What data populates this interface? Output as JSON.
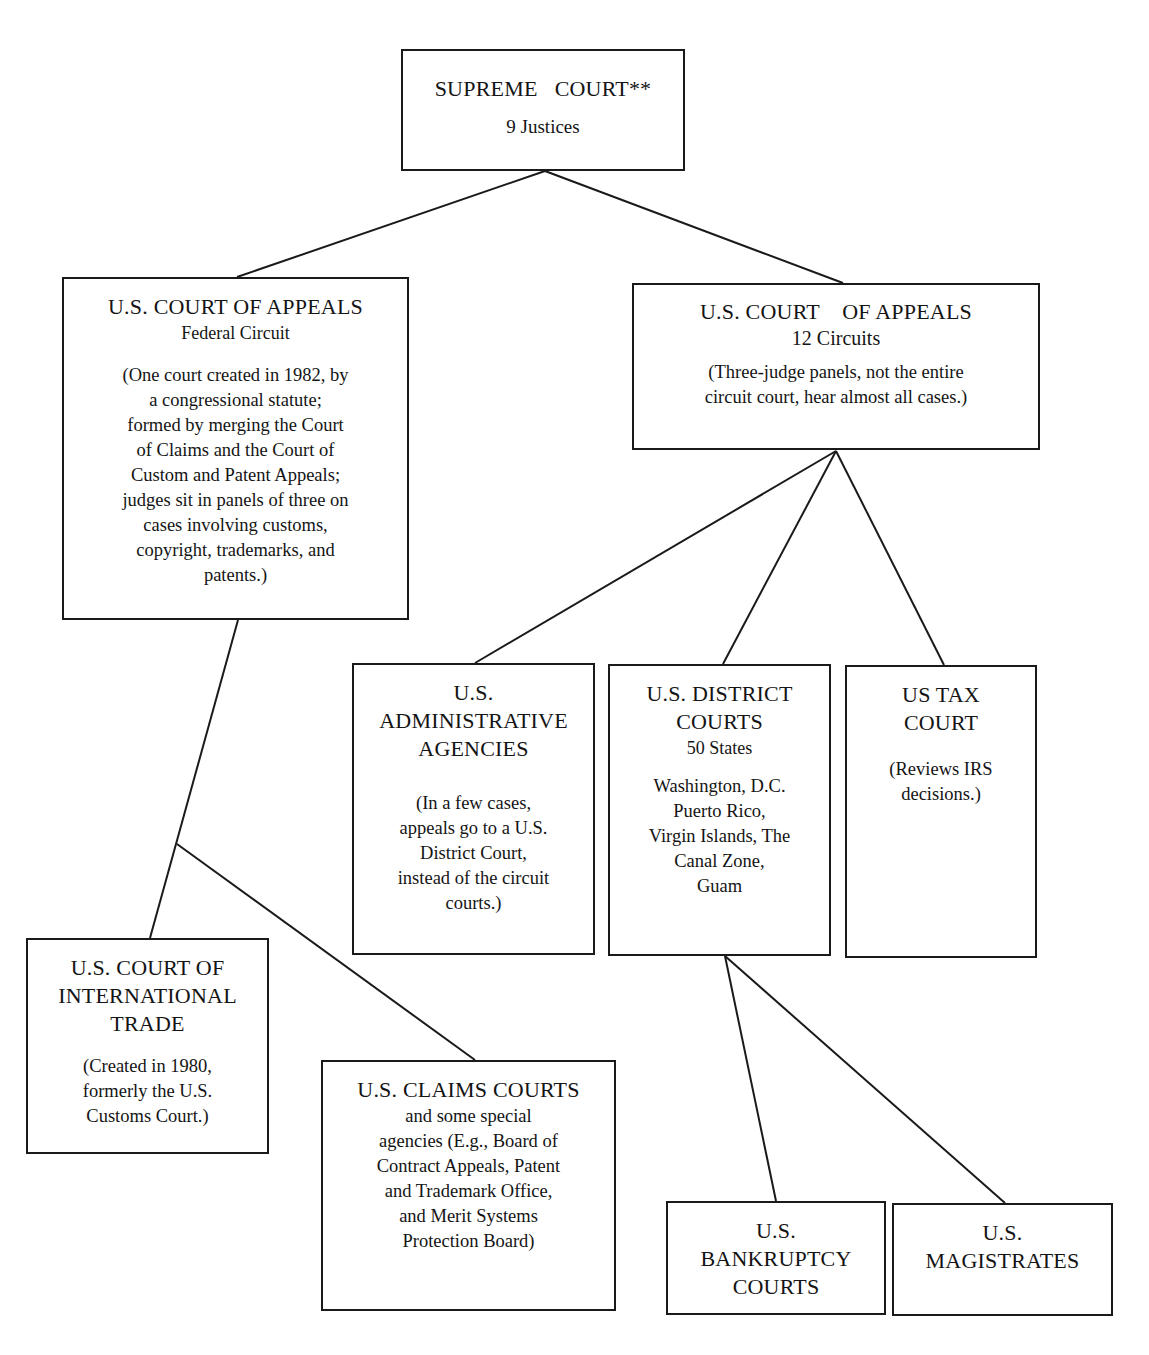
{
  "diagram": {
    "type": "org-chart"
  },
  "nodes": {
    "supreme": {
      "title": "SUPREME   COURT**",
      "subtitle": "9 Justices"
    },
    "federal_circuit": {
      "title": "U.S. COURT OF APPEALS",
      "subtitle": "Federal Circuit",
      "note": "(One court created in 1982, by\na congressional statute;\nformed by merging the Court\nof Claims and the Court of\nCustom and Patent Appeals;\njudges sit in panels of three on\ncases involving customs,\ncopyright, trademarks, and\npatents.)"
    },
    "circuits": {
      "title": "U.S. COURT    OF APPEALS",
      "subtitle": "12 Circuits",
      "note": "(Three-judge panels, not the entire\ncircuit court, hear almost all cases.)"
    },
    "admin_agencies": {
      "title": "U.S.\nADMINISTRATIVE\nAGENCIES",
      "note": "(In a few cases,\nappeals go to a U.S.\nDistrict Court,\ninstead of the circuit\ncourts.)"
    },
    "district_courts": {
      "title": "U.S. DISTRICT\nCOURTS",
      "subtitle": "50 States",
      "note": "Washington, D.C.\nPuerto Rico,\nVirgin Islands, The\nCanal Zone,\nGuam"
    },
    "tax_court": {
      "title": "US TAX\nCOURT",
      "note": "(Reviews IRS\ndecisions.)"
    },
    "international_trade": {
      "title": "U.S. COURT OF\nINTERNATIONAL\nTRADE",
      "note": "(Created in 1980,\nformerly the U.S.\nCustoms Court.)"
    },
    "claims_courts": {
      "title": "U.S. CLAIMS COURTS",
      "note": "and some special\nagencies (E.g., Board of\nContract Appeals, Patent\nand Trademark Office,\nand Merit Systems\nProtection Board)"
    },
    "bankruptcy": {
      "title": "U.S.\nBANKRUPTCY\nCOURTS"
    },
    "magistrates": {
      "title": "U.S.\nMAGISTRATES"
    }
  },
  "edges": [
    [
      "supreme",
      "federal_circuit"
    ],
    [
      "supreme",
      "circuits"
    ],
    [
      "federal_circuit",
      "international_trade"
    ],
    [
      "federal_circuit",
      "claims_courts"
    ],
    [
      "circuits",
      "admin_agencies"
    ],
    [
      "circuits",
      "district_courts"
    ],
    [
      "circuits",
      "tax_court"
    ],
    [
      "district_courts",
      "bankruptcy"
    ],
    [
      "district_courts",
      "magistrates"
    ]
  ],
  "colors": {
    "line": "#1a1a1a",
    "background": "#ffffff",
    "text": "#141414"
  }
}
